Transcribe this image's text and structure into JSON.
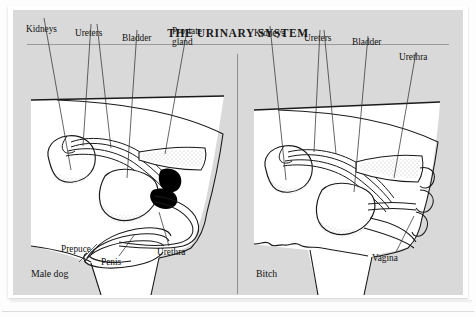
{
  "figure": {
    "title": "THE URINARY SYSTEM",
    "background_color": "#d9d9d9",
    "page_color": "#ffffff",
    "ink_color": "#111111"
  },
  "panels": [
    {
      "id": "male",
      "caption": "Male dog",
      "labels": [
        {
          "name": "kidneys",
          "text": "Kidneys"
        },
        {
          "name": "ureters",
          "text": "Ureters"
        },
        {
          "name": "bladder",
          "text": "Bladder"
        },
        {
          "name": "prostate",
          "text": "Prostate\ngland"
        },
        {
          "name": "prepuce",
          "text": "Prepuce"
        },
        {
          "name": "penis",
          "text": "Penis"
        },
        {
          "name": "urethra",
          "text": "Urethra"
        }
      ]
    },
    {
      "id": "female",
      "caption": "Bitch",
      "labels": [
        {
          "name": "kidneys",
          "text": "Kidneys"
        },
        {
          "name": "ureters",
          "text": "Ureters"
        },
        {
          "name": "bladder",
          "text": "Bladder"
        },
        {
          "name": "urethra",
          "text": "Urethra"
        },
        {
          "name": "vagina",
          "text": "Vagina"
        }
      ]
    }
  ]
}
